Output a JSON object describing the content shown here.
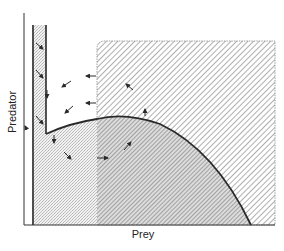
{
  "diagram": {
    "x_axis_label": "Prey",
    "y_axis_label": "Predator",
    "regions": [
      {
        "name": "left-stippled-strip",
        "fill": "stipple"
      },
      {
        "name": "upper-hatched-region",
        "fill": "diagonal-hatch"
      },
      {
        "name": "lower-cross-region",
        "fill": "dense-hatch-stipple"
      },
      {
        "name": "lower-stippled-region",
        "fill": "stipple"
      },
      {
        "name": "white-interior-region",
        "fill": "none"
      }
    ],
    "boundary": "hump-shaped isocline curve",
    "arrows_count": 13,
    "colors": {
      "line": "#2a2a2a",
      "stipple": "#cfcfcf",
      "hatch": "#9a9a9a",
      "background": "#ffffff"
    }
  }
}
